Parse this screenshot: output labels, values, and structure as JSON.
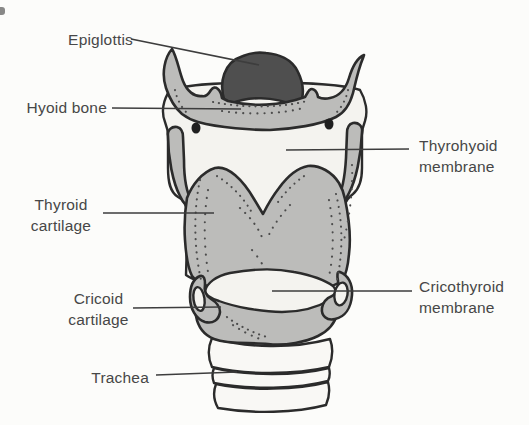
{
  "labels": [
    {
      "id": "epiglottis",
      "text": "Epiglottis"
    },
    {
      "id": "hyoid-bone",
      "text": "Hyoid bone"
    },
    {
      "id": "thyrohyoid-membrane",
      "text": "Thyrohyoid membrane"
    },
    {
      "id": "thyroid-cartilage",
      "text": "Thyroid cartilage"
    },
    {
      "id": "cricothyroid-membrane",
      "text": "Cricothyroid membrane"
    },
    {
      "id": "cricoid-cartilage",
      "text": "Cricoid cartilage"
    },
    {
      "id": "trachea",
      "text": "Trachea"
    }
  ],
  "colors": {
    "background": "#fcfcfa",
    "outline": "#2b2b2b",
    "cartilage_gray": "#bcbcba",
    "epiglottis_dark": "#4f4f4f",
    "membrane_light": "#f4f3ef",
    "trachea_white": "#f9f8f5",
    "label_text": "#474747",
    "leader_line": "#3d3d3d"
  }
}
